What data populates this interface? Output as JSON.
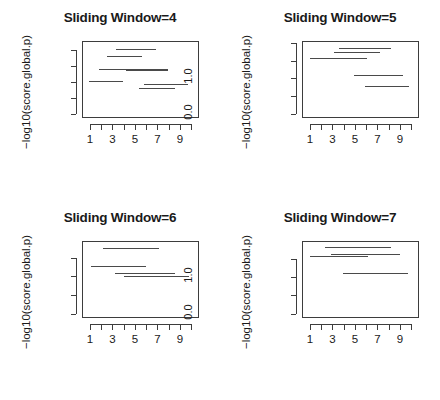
{
  "figure": {
    "layout": "2x2 grid of line-segment plots",
    "ylabel": "−log10(score.global.p)",
    "xlabel": ""
  },
  "chart_data": [
    {
      "type": "line",
      "title": "Sliding Window=4",
      "xlabel": "",
      "ylabel": "-log10(score.global.p)",
      "xlim": [
        0.3,
        10.7
      ],
      "ylim": [
        -0.12,
        2.28
      ],
      "grid": false,
      "legend": null,
      "xticks": [
        1,
        2,
        3,
        4,
        5,
        6,
        7,
        8,
        9,
        10
      ],
      "xticklabels": [
        "1",
        "",
        "3",
        "",
        "5",
        "",
        "7",
        "",
        "9",
        ""
      ],
      "yticks": [
        0.0,
        0.5,
        1.0,
        1.5,
        2.0
      ],
      "yticklabels": [
        "0.0",
        "",
        "1.0",
        "",
        "2.0"
      ],
      "segments": [
        {
          "x0": 3.3,
          "x1": 6.9,
          "y": 2.02
        },
        {
          "x0": 2.5,
          "x1": 5.6,
          "y": 1.82
        },
        {
          "x0": 1.8,
          "x1": 7.9,
          "y": 1.42
        },
        {
          "x0": 4.2,
          "x1": 7.9,
          "y": 1.38
        },
        {
          "x0": 0.9,
          "x1": 3.9,
          "y": 1.03
        },
        {
          "x0": 5.8,
          "x1": 9.7,
          "y": 0.93
        },
        {
          "x0": 5.4,
          "x1": 8.6,
          "y": 0.83
        }
      ]
    },
    {
      "type": "line",
      "title": "Sliding Window=5",
      "xlabel": "",
      "ylabel": "-log10(score.global.p)",
      "xlim": [
        0.3,
        10.7
      ],
      "ylim": [
        -0.12,
        2.05
      ],
      "grid": false,
      "legend": null,
      "xticks": [
        1,
        2,
        3,
        4,
        5,
        6,
        7,
        8,
        9,
        10
      ],
      "xticklabels": [
        "1",
        "",
        "3",
        "",
        "5",
        "",
        "7",
        "",
        "9",
        ""
      ],
      "yticks": [
        0.0,
        0.5,
        1.0,
        1.5,
        2.0
      ],
      "yticklabels": [
        "0.0",
        "",
        "1.0",
        "",
        ""
      ],
      "segments": [
        {
          "x0": 3.6,
          "x1": 8.2,
          "y": 1.84
        },
        {
          "x0": 3.1,
          "x1": 7.2,
          "y": 1.74
        },
        {
          "x0": 1.0,
          "x1": 6.1,
          "y": 1.58
        },
        {
          "x0": 4.9,
          "x1": 9.3,
          "y": 1.1
        },
        {
          "x0": 5.9,
          "x1": 9.8,
          "y": 0.78
        }
      ]
    },
    {
      "type": "line",
      "title": "Sliding Window=6",
      "xlabel": "",
      "ylabel": "-log10(score.global.p)",
      "xlim": [
        0.3,
        10.7
      ],
      "ylim": [
        -0.12,
        1.95
      ],
      "grid": false,
      "legend": null,
      "xticks": [
        1,
        2,
        3,
        4,
        5,
        6,
        7,
        8,
        9,
        10
      ],
      "xticklabels": [
        "1",
        "",
        "3",
        "",
        "5",
        "",
        "7",
        "",
        "9",
        ""
      ],
      "yticks": [
        0.0,
        0.5,
        1.0,
        1.5
      ],
      "yticklabels": [
        "0.0",
        "",
        "1.0",
        ""
      ],
      "segments": [
        {
          "x0": 2.2,
          "x1": 7.1,
          "y": 1.76
        },
        {
          "x0": 1.1,
          "x1": 6.0,
          "y": 1.28
        },
        {
          "x0": 3.2,
          "x1": 8.6,
          "y": 1.1
        },
        {
          "x0": 4.0,
          "x1": 9.8,
          "y": 1.0
        }
      ]
    },
    {
      "type": "line",
      "title": "Sliding Window=7",
      "xlabel": "",
      "ylabel": "-log10(score.global.p)",
      "xlim": [
        0.3,
        10.7
      ],
      "ylim": [
        -0.12,
        2.0
      ],
      "grid": false,
      "legend": null,
      "xticks": [
        1,
        2,
        3,
        4,
        5,
        6,
        7,
        8,
        9,
        10
      ],
      "xticklabels": [
        "1",
        "",
        "3",
        "",
        "5",
        "",
        "7",
        "",
        "9",
        ""
      ],
      "yticks": [
        0.0,
        0.5,
        1.0,
        1.5
      ],
      "yticklabels": [
        "0.0",
        "",
        "1.0",
        ""
      ],
      "segments": [
        {
          "x0": 2.3,
          "x1": 8.2,
          "y": 1.83
        },
        {
          "x0": 2.9,
          "x1": 9.0,
          "y": 1.64
        },
        {
          "x0": 1.0,
          "x1": 6.2,
          "y": 1.6
        },
        {
          "x0": 3.9,
          "x1": 9.7,
          "y": 1.12
        }
      ]
    }
  ]
}
